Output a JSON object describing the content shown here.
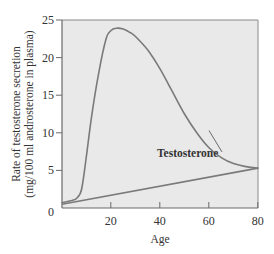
{
  "chart_data": {
    "type": "line",
    "title": "",
    "xlabel": "Age",
    "ylabel_line1": "Rate of testosterone secretion",
    "ylabel_line2": "(mg/100 ml androsterone in plasma)",
    "xlim": [
      0,
      80
    ],
    "ylim": [
      0,
      25
    ],
    "xticks": [
      20,
      40,
      60,
      80
    ],
    "yticks": [
      0,
      5,
      10,
      15,
      20,
      25
    ],
    "grid": false,
    "background": "#e9e9e9",
    "line_color": "#7a7a7a",
    "series": [
      {
        "name": "Testosterone",
        "x": [
          0,
          4,
          6,
          8,
          10,
          12,
          15,
          18,
          20,
          22,
          25,
          28,
          30,
          35,
          40,
          45,
          50,
          55,
          60,
          65,
          70,
          75,
          80
        ],
        "y": [
          0.7,
          1.0,
          1.3,
          2.5,
          7.0,
          12.0,
          18.0,
          22.5,
          23.6,
          23.9,
          23.8,
          23.3,
          22.8,
          21.0,
          18.5,
          15.5,
          12.5,
          10.0,
          8.0,
          6.7,
          5.9,
          5.5,
          5.3
        ]
      },
      {
        "name": "baseline",
        "x": [
          0,
          80
        ],
        "y": [
          0.5,
          5.3
        ]
      }
    ],
    "annotations": [
      {
        "text": "Testosterone",
        "x": 48,
        "y": 9.2,
        "points_to": {
          "x": 60,
          "y": 10.3
        }
      }
    ]
  }
}
